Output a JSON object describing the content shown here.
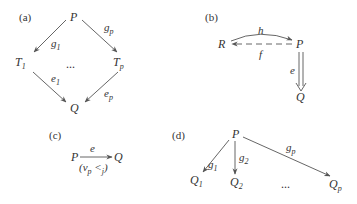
{
  "colors": {
    "ink": "#333333",
    "stroke": "#555555",
    "background": "#ffffff"
  },
  "panels": {
    "a": {
      "label": "(a)",
      "nodes": {
        "top": "P",
        "left": "T",
        "left_sub": "1",
        "right": "T",
        "right_sub": "p",
        "bottom": "Q"
      },
      "ellipsis": "...",
      "edges": {
        "g1": {
          "name": "g",
          "sub": "1"
        },
        "gp": {
          "name": "g",
          "sub": "p"
        },
        "e1": {
          "name": "e",
          "sub": "1"
        },
        "ep": {
          "name": "e",
          "sub": "p"
        }
      }
    },
    "b": {
      "label": "(b)",
      "nodes": {
        "left": "R",
        "right": "P",
        "bottom": "Q"
      },
      "edges": {
        "h": {
          "name": "h",
          "style": "curved solid arrow R→P"
        },
        "f": {
          "name": "f",
          "style": "dashed arrow P→R"
        },
        "e": {
          "name": "e",
          "style": "double arrow P⇒Q"
        }
      }
    },
    "c": {
      "label": "(c)",
      "nodes": {
        "left": "P",
        "right": "Q"
      },
      "edges": {
        "e": {
          "name": "e",
          "annotation_open": "(",
          "annotation_v": "v",
          "annotation_v_sub": "p",
          "annotation_rel": " <",
          "annotation_rel_sub": "j",
          "annotation_close": ")"
        }
      }
    },
    "d": {
      "label": "(d)",
      "nodes": {
        "top": "P",
        "q1": "Q",
        "q1_sub": "1",
        "q2": "Q",
        "q2_sub": "2",
        "qp": "Q",
        "qp_sub": "p"
      },
      "ellipsis": "...",
      "edges": {
        "g1": {
          "name": "g",
          "sub": "1"
        },
        "g2": {
          "name": "g",
          "sub": "2"
        },
        "gp": {
          "name": "g",
          "sub": "p"
        }
      }
    }
  }
}
